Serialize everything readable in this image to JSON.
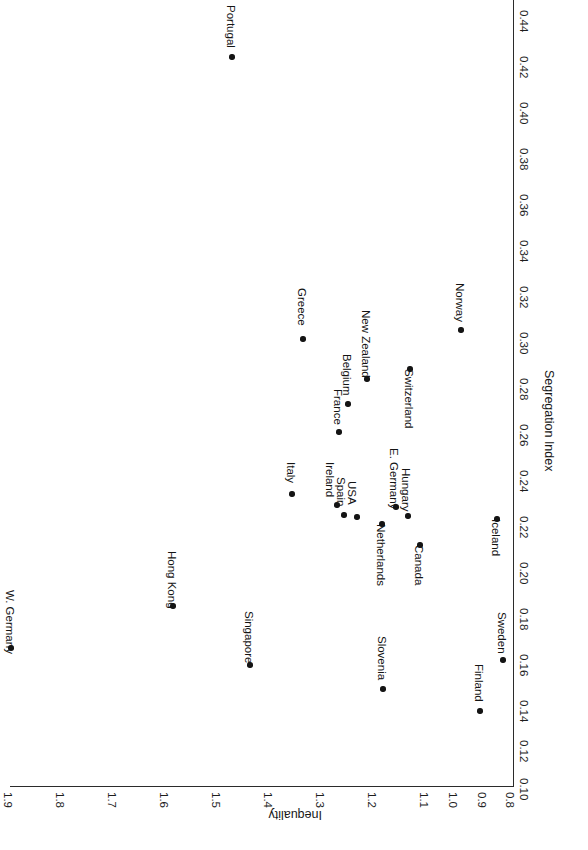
{
  "chart_data": {
    "type": "scatter",
    "title": "",
    "xlabel": "Segregation Index",
    "ylabel": "Inequality",
    "xlim": [
      0.1,
      0.44
    ],
    "ylim": [
      0.8,
      1.9
    ],
    "xticks": [
      "0.10",
      "0.12",
      "0.14",
      "0.16",
      "0.18",
      "0.20",
      "0.22",
      "0.24",
      "0.26",
      "0.28",
      "0.30",
      "0.32",
      "0.34",
      "0.36",
      "0.38",
      "0.40",
      "0.42",
      "0.44"
    ],
    "yticks": [
      "0.8",
      "0.9",
      "1.0",
      "1.1",
      "1.2",
      "1.3",
      "1.4",
      "1.5",
      "1.6",
      "1.7",
      "1.8",
      "1.9"
    ],
    "grid": false,
    "legend": null,
    "orientation": "rotated-90-clockwise",
    "marker_color": "#141414",
    "points": [
      {
        "label": "W. Germany",
        "x": 0.16,
        "y": 1.91,
        "px": 11,
        "py": 648,
        "lx": 10,
        "ly": 590,
        "ldir": 90
      },
      {
        "label": "Hong Kong",
        "x": 0.188,
        "y": 1.59,
        "px": 173,
        "py": 606,
        "lx": 172,
        "ly": 551,
        "ldir": 90
      },
      {
        "label": "Singapore",
        "x": 0.163,
        "y": 1.44,
        "px": 250,
        "py": 665,
        "lx": 249,
        "ly": 611,
        "ldir": 90
      },
      {
        "label": "Portugal",
        "x": 0.417,
        "y": 1.48,
        "px": 232,
        "py": 57,
        "lx": 231,
        "ly": 5,
        "ldir": 90
      },
      {
        "label": "Greece",
        "x": 0.294,
        "y": 1.32,
        "px": 303,
        "py": 339,
        "lx": 302,
        "ly": 288,
        "ldir": 90
      },
      {
        "label": "Italy",
        "x": 0.227,
        "y": 1.26,
        "px": 292,
        "py": 494,
        "lx": 291,
        "ly": 462,
        "ldir": 90
      },
      {
        "label": "New Zealand",
        "x": 0.287,
        "y": 1.18,
        "px": 367,
        "py": 379,
        "lx": 366,
        "ly": 310,
        "ldir": 90
      },
      {
        "label": "Belgium",
        "x": 0.276,
        "y": 1.21,
        "px": 348,
        "py": 404,
        "lx": 347,
        "ly": 354,
        "ldir": 90
      },
      {
        "label": "France",
        "x": 0.264,
        "y": 1.23,
        "px": 339,
        "py": 432,
        "lx": 338,
        "ly": 389,
        "ldir": 90
      },
      {
        "label": "Ireland",
        "x": 0.222,
        "y": 1.24,
        "px": 337,
        "py": 505,
        "lx": 330,
        "ly": 462,
        "ldir": 90
      },
      {
        "label": "Spain",
        "x": 0.218,
        "y": 1.22,
        "px": 344,
        "py": 515,
        "lx": 341,
        "ly": 477,
        "ldir": 90
      },
      {
        "label": "USA",
        "x": 0.217,
        "y": 1.2,
        "px": 357,
        "py": 517,
        "lx": 352,
        "ly": 481,
        "ldir": 90
      },
      {
        "label": "E. Germany",
        "x": 0.222,
        "y": 1.12,
        "px": 396,
        "py": 507,
        "lx": 394,
        "ly": 448,
        "ldir": 90
      },
      {
        "label": "Hungary",
        "x": 0.218,
        "y": 1.09,
        "px": 408,
        "py": 516,
        "lx": 406,
        "ly": 468,
        "ldir": 90
      },
      {
        "label": "Netherlands",
        "x": 0.214,
        "y": 1.14,
        "px": 382,
        "py": 524,
        "lx": 381,
        "ly": 524,
        "ldir": 90
      },
      {
        "label": "Canada",
        "x": 0.205,
        "y": 1.07,
        "px": 420,
        "py": 545,
        "lx": 419,
        "ly": 545,
        "ldir": 90
      },
      {
        "label": "Switzerland",
        "x": 0.282,
        "y": 1.11,
        "px": 410,
        "py": 369,
        "lx": 409,
        "ly": 369,
        "ldir": 90
      },
      {
        "label": "Norway",
        "x": 0.308,
        "y": 0.99,
        "px": 461,
        "py": 330,
        "lx": 460,
        "ly": 283,
        "ldir": 90
      },
      {
        "label": "Iceland",
        "x": 0.216,
        "y": 0.92,
        "px": 497,
        "py": 519,
        "lx": 496,
        "ly": 519,
        "ldir": 90
      },
      {
        "label": "Sweden",
        "x": 0.165,
        "y": 0.87,
        "px": 503,
        "py": 660,
        "lx": 502,
        "ly": 612,
        "ldir": 90
      },
      {
        "label": "Slovenia",
        "x": 0.153,
        "y": 1.19,
        "px": 383,
        "py": 689,
        "lx": 382,
        "ly": 636,
        "ldir": 90
      },
      {
        "label": "Finland",
        "x": 0.133,
        "y": 0.93,
        "px": 480,
        "py": 711,
        "lx": 479,
        "ly": 664,
        "ldir": 90
      }
    ]
  },
  "axes": {
    "inequality": {
      "title": "Inequality",
      "title_px": {
        "x": 322,
        "y": 822
      },
      "ticks": [
        {
          "label": "1.9",
          "px": 14,
          "py": 792
        },
        {
          "label": "1.8",
          "px": 66,
          "py": 792
        },
        {
          "label": "1.7",
          "px": 118,
          "py": 792
        },
        {
          "label": "1.6",
          "px": 170,
          "py": 792
        },
        {
          "label": "1.5",
          "px": 222,
          "py": 792
        },
        {
          "label": "1.4",
          "px": 274,
          "py": 792
        },
        {
          "label": "1.3",
          "px": 326,
          "py": 792
        },
        {
          "label": "1.2",
          "px": 378,
          "py": 792
        },
        {
          "label": "1.1",
          "px": 430,
          "py": 792
        },
        {
          "label": "1.0",
          "px": 459,
          "py": 792
        },
        {
          "label": "0.9",
          "px": 488,
          "py": 792
        },
        {
          "label": "0.8",
          "px": 516,
          "py": 792
        }
      ]
    },
    "segregation": {
      "title": "Segregation Index",
      "title_px": {
        "x": 556,
        "y": 370
      },
      "ticks": [
        {
          "label": "0.44",
          "px": 530,
          "py": 10
        },
        {
          "label": "0.42",
          "px": 530,
          "py": 56
        },
        {
          "label": "0.40",
          "px": 530,
          "py": 102
        },
        {
          "label": "0.38",
          "px": 530,
          "py": 148
        },
        {
          "label": "0.36",
          "px": 530,
          "py": 194
        },
        {
          "label": "0.34",
          "px": 530,
          "py": 240
        },
        {
          "label": "0.32",
          "px": 530,
          "py": 286
        },
        {
          "label": "0.30",
          "px": 530,
          "py": 332
        },
        {
          "label": "0.28",
          "px": 530,
          "py": 378
        },
        {
          "label": "0.26",
          "px": 530,
          "py": 424
        },
        {
          "label": "0.24",
          "px": 530,
          "py": 470
        },
        {
          "label": "0.22",
          "px": 530,
          "py": 516
        },
        {
          "label": "0.20",
          "px": 530,
          "py": 562
        },
        {
          "label": "0.18",
          "px": 530,
          "py": 608
        },
        {
          "label": "0.16",
          "px": 530,
          "py": 654
        },
        {
          "label": "0.14",
          "px": 530,
          "py": 700
        },
        {
          "label": "0.12",
          "px": 530,
          "py": 740
        },
        {
          "label": "0.10",
          "px": 530,
          "py": 778
        }
      ]
    }
  }
}
